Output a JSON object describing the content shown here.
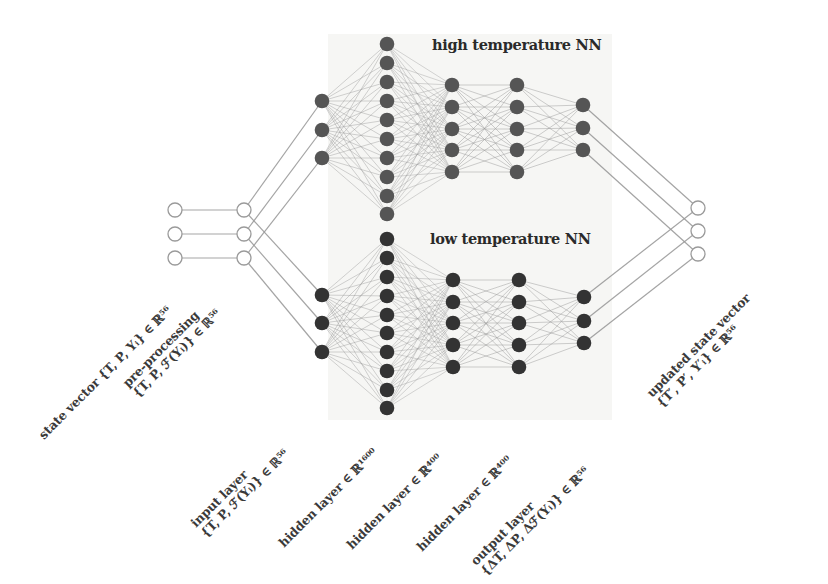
{
  "diagram": {
    "colors": {
      "background": "#ffffff",
      "panel": "#f6f6f4",
      "high_node": "#555555",
      "low_node": "#333333",
      "edge": "#9a9a9a",
      "open_node_stroke": "#9a9a9a",
      "text": "#3a3a3a"
    },
    "titles": {
      "high": "high temperature NN",
      "low": "low temperature NN"
    },
    "labels": {
      "state_vector": "state vector {T, P, Yᵢ} ∈ ℝ⁵⁶",
      "pre_processing_1": "pre-processing",
      "pre_processing_2": "{T, P, ℱ(Yᵢ)} ∈ ℝ⁵⁶",
      "input_layer_1": "input layer",
      "input_layer_2": "{T, P, ℱ(Yᵢ)} ∈ ℝ⁵⁶",
      "hidden_1": "hidden layer ∈ ℝ¹⁶⁰⁰",
      "hidden_2": "hidden layer ∈ ℝ⁴⁰⁰",
      "hidden_3": "hidden layer ∈ ℝ⁴⁰⁰",
      "output_layer_1": "output layer",
      "output_layer_2": "{ΔT, ΔP, Δℱ(Yᵢ)} ∈ ℝ⁵⁶",
      "updated_1": "updated state vector",
      "updated_2": "{T′, P′, Y′ᵢ} ∈ ℝ⁵⁶"
    },
    "nodes": {
      "state_vector": {
        "x": 175,
        "y": [
          210,
          234,
          258
        ],
        "open": true
      },
      "pre_processing": {
        "x": 244,
        "y": [
          210,
          234,
          258
        ],
        "open": true
      },
      "updated_state": {
        "x": 698,
        "y": [
          208,
          231,
          254
        ],
        "open": true
      },
      "high": {
        "input": {
          "x": 322,
          "y": [
            101,
            130,
            158
          ]
        },
        "hidden1": {
          "x": 387,
          "y": [
            44,
            63,
            82,
            101,
            120,
            139,
            158,
            177,
            196,
            214
          ]
        },
        "hidden2": {
          "x": 452,
          "y": [
            85,
            107,
            129,
            150,
            172
          ]
        },
        "hidden3": {
          "x": 517,
          "y": [
            85,
            107,
            129,
            150,
            172
          ]
        },
        "output": {
          "x": 583,
          "y": [
            105,
            128,
            150
          ]
        }
      },
      "low": {
        "input": {
          "x": 322,
          "y": [
            295,
            323,
            352
          ]
        },
        "hidden1": {
          "x": 387,
          "y": [
            239,
            258,
            277,
            296,
            315,
            333,
            352,
            371,
            390,
            408
          ]
        },
        "hidden2": {
          "x": 453,
          "y": [
            280,
            302,
            323,
            345,
            367
          ]
        },
        "hidden3": {
          "x": 519,
          "y": [
            280,
            302,
            323,
            345,
            367
          ]
        },
        "output": {
          "x": 584,
          "y": [
            297,
            321,
            343
          ]
        }
      }
    }
  }
}
